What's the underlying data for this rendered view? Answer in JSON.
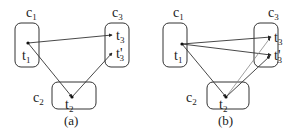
{
  "panels": [
    {
      "caption": "(a)",
      "clusters": [
        {
          "id": "c1",
          "label": "c",
          "sub": "1"
        },
        {
          "id": "c2",
          "label": "c",
          "sub": "2"
        },
        {
          "id": "c3",
          "label": "c",
          "sub": "3"
        }
      ],
      "nodes": [
        {
          "id": "t1",
          "label": "t",
          "sub": "1"
        },
        {
          "id": "t2",
          "label": "t",
          "sub": "2"
        },
        {
          "id": "t3",
          "label": "t",
          "sub": "3"
        },
        {
          "id": "t3p",
          "label": "t'",
          "sub": "3"
        }
      ],
      "edges": [
        [
          "t1",
          "t3"
        ],
        [
          "t1",
          "t2"
        ],
        [
          "t2",
          "t3p"
        ]
      ]
    },
    {
      "caption": "(b)",
      "clusters": [
        {
          "id": "c1",
          "label": "c",
          "sub": "1"
        },
        {
          "id": "c2",
          "label": "c",
          "sub": "2"
        },
        {
          "id": "c3",
          "label": "c",
          "sub": "3"
        }
      ],
      "nodes": [
        {
          "id": "t1",
          "label": "t",
          "sub": "1"
        },
        {
          "id": "t2",
          "label": "t",
          "sub": "2"
        },
        {
          "id": "t3",
          "label": "t",
          "sub": "3"
        },
        {
          "id": "t3p",
          "label": "t'",
          "sub": "3"
        }
      ],
      "edges": [
        [
          "t1",
          "t3"
        ],
        [
          "t1",
          "t3p"
        ],
        [
          "t1",
          "t2"
        ],
        [
          "t2",
          "t3"
        ],
        [
          "t2",
          "t3p"
        ]
      ]
    }
  ]
}
